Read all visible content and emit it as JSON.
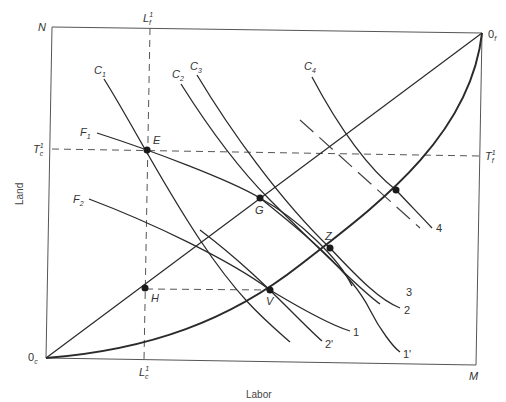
{
  "diagram": {
    "type": "edgeworth-box",
    "axes": {
      "x_title": "Labor",
      "y_title": "Land"
    },
    "corners": {
      "top_left": "N",
      "top_right": {
        "base": "0",
        "sub": "f"
      },
      "bottom_left": {
        "base": "0",
        "sub": "c"
      },
      "bottom_right": "M"
    },
    "reference_lines": {
      "vertical": {
        "top_label": {
          "base": "L",
          "sub": "f",
          "sup": "1"
        },
        "bottom_label": {
          "base": "L",
          "sub": "c",
          "sup": "1"
        }
      },
      "horizontal": {
        "left_label": {
          "base": "T",
          "sub": "c",
          "sup": "1"
        },
        "right_label": {
          "base": "T",
          "sub": "f",
          "sup": "1"
        }
      }
    },
    "curve_labels": {
      "C1": {
        "base": "C",
        "sub": "1"
      },
      "C2": {
        "base": "C",
        "sub": "2"
      },
      "C3": {
        "base": "C",
        "sub": "3"
      },
      "C4": {
        "base": "C",
        "sub": "4"
      },
      "F1": {
        "base": "F",
        "sub": "1"
      },
      "F2": {
        "base": "F",
        "sub": "2"
      }
    },
    "end_labels": {
      "one": "1",
      "two_prime": "2'",
      "one_prime": "1'",
      "two": "2",
      "three": "3",
      "four": "4"
    },
    "points": {
      "E": "E",
      "G": "G",
      "Z": "Z",
      "V": "V",
      "H": "H"
    },
    "colors": {
      "line": "#2a2a2a",
      "frame": "#555555",
      "dashed": "#555555"
    }
  }
}
